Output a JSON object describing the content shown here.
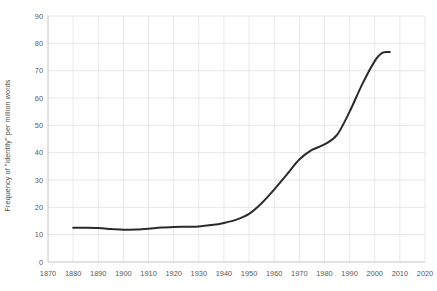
{
  "chart_data": {
    "type": "line",
    "title": "",
    "xlabel": "",
    "ylabel": "Frequency of \"identity\" per million words",
    "xlim": [
      1870,
      2020
    ],
    "ylim": [
      0,
      90
    ],
    "grid": true,
    "legend": "none",
    "xticks": [
      1870,
      1880,
      1890,
      1900,
      1910,
      1920,
      1930,
      1940,
      1950,
      1960,
      1970,
      1980,
      1990,
      2000,
      2010,
      2020
    ],
    "yticks": [
      0,
      10,
      20,
      30,
      40,
      50,
      60,
      70,
      80,
      90
    ],
    "line_color": "#2b2b2b",
    "series": [
      {
        "name": "Frequency of \"identity\" per million words",
        "x": [
          1880,
          1885,
          1890,
          1895,
          1900,
          1905,
          1910,
          1915,
          1920,
          1925,
          1930,
          1935,
          1940,
          1945,
          1950,
          1955,
          1960,
          1965,
          1970,
          1975,
          1980,
          1985,
          1990,
          1995,
          2000,
          2003,
          2006
        ],
        "values": [
          12.5,
          12.5,
          12.4,
          12.1,
          11.8,
          11.9,
          12.2,
          12.6,
          12.8,
          12.9,
          13.0,
          13.5,
          14.3,
          15.5,
          17.6,
          21.5,
          26.5,
          32.0,
          37.5,
          41.0,
          43.0,
          46.5,
          55.0,
          65.0,
          73.5,
          76.5,
          76.8
        ]
      }
    ]
  },
  "axes": {
    "y_title": "Frequency of \"identity\" per million words"
  }
}
